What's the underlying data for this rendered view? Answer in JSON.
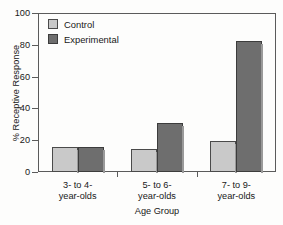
{
  "chart_data": {
    "type": "bar",
    "title": "",
    "xlabel": "Age Group",
    "ylabel": "% Receptive Response",
    "categories": [
      "3- to 4-\nyear-olds",
      "5- to 6-\nyear-olds",
      "7- to 9-\nyear-olds"
    ],
    "category_lines": [
      {
        "line1": "3- to 4-",
        "line2": "year-olds"
      },
      {
        "line1": "5- to 6-",
        "line2": "year-olds"
      },
      {
        "line1": "7- to 9-",
        "line2": "year-olds"
      }
    ],
    "series": [
      {
        "name": "Control",
        "color": "#c9c9c9",
        "values": [
          16,
          14.5,
          19.5
        ]
      },
      {
        "name": "Experimental",
        "color": "#6e6e6e",
        "values": [
          16,
          31,
          82.5
        ]
      }
    ],
    "ylim": [
      0,
      100
    ],
    "yticks": [
      0,
      20,
      40,
      60,
      80,
      100
    ],
    "ytick_labels": [
      "0",
      "20",
      "40",
      "60",
      "80",
      "100"
    ],
    "grid": false,
    "legend_position": "top-left"
  },
  "legend": {
    "items": [
      {
        "label": "Control",
        "color": "#c9c9c9"
      },
      {
        "label": "Experimental",
        "color": "#6e6e6e"
      }
    ]
  },
  "axes": {
    "y_title": "% Receptive Response",
    "x_title": "Age Group",
    "y_ticks": [
      "100",
      "80",
      "60",
      "40",
      "20",
      "0"
    ]
  },
  "colors": {
    "control": "#c9c9c9",
    "experimental": "#6e6e6e",
    "axis": "#5b5b5b",
    "text": "#181818",
    "background": "#fdfdfc"
  }
}
